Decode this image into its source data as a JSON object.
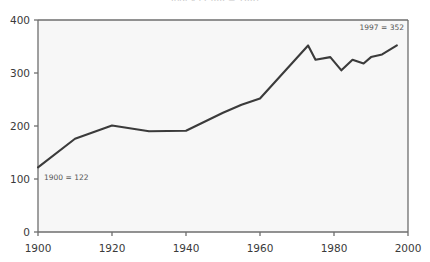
{
  "title_clipped": "Index (1900 = 100)",
  "chart_data": {
    "type": "line",
    "title": "",
    "xlabel": "",
    "ylabel": "",
    "xlim": [
      1900,
      2000
    ],
    "ylim": [
      0,
      400
    ],
    "grid": false,
    "legend": "none",
    "line_color": "#3b3b3b",
    "plot_background": "#f7f7f7",
    "axis_color": "#6e6e6e",
    "yticks": [
      "0",
      "100",
      "200",
      "300",
      "400"
    ],
    "ytick_values": [
      0,
      100,
      200,
      300,
      400
    ],
    "xticks": [
      "1900",
      "1920",
      "1940",
      "1960",
      "1980",
      "2000"
    ],
    "xtick_values": [
      1900,
      1920,
      1940,
      1960,
      1980,
      2000
    ],
    "x": [
      1900,
      1910,
      1920,
      1930,
      1940,
      1950,
      1955,
      1960,
      1973,
      1975,
      1979,
      1982,
      1985,
      1988,
      1990,
      1993,
      1997
    ],
    "values": [
      122,
      176,
      201,
      190,
      191,
      225,
      240,
      252,
      352,
      325,
      330,
      305,
      325,
      318,
      330,
      335,
      352
    ],
    "annotations": [
      {
        "id": "start-annotation",
        "text": "1900 = 122",
        "x": 1900,
        "y": 122
      },
      {
        "id": "end-annotation",
        "text": "1997 = 352",
        "x": 1997,
        "y": 352
      }
    ]
  }
}
